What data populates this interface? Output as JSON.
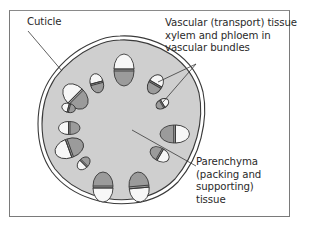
{
  "figure": {
    "labels": {
      "cuticle": "Cuticle",
      "vascular": [
        "Vascular (transport) tissue –",
        "xylem and phloem in",
        "vascular bundles"
      ],
      "parenchyma": [
        "Parenchyma",
        "(packing and",
        "supporting)",
        "tissue"
      ]
    },
    "colors": {
      "parenchyma_fill": "#cfcfcf",
      "phloem_fill": "#9b9b9b",
      "xylem_fill": "#f7f7f7",
      "outline": "#3a3a3a",
      "frame": "#7a7a7a",
      "label_text": "#2a2a2a"
    }
  }
}
